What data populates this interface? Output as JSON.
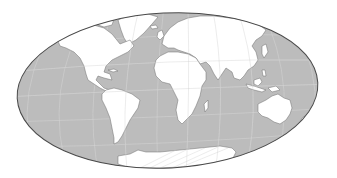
{
  "map": {
    "title": "World map (Mollweide-style equal-area projection)",
    "projection": "mollweide",
    "colors": {
      "ocean": "#bcbcbc",
      "land": "#ffffff",
      "coastline": "#6e6e6e",
      "graticule": "#d8d8d8",
      "outline": "#4a4a4a",
      "background": "#ffffff"
    },
    "graticule": {
      "meridians": 12,
      "parallels": 5
    },
    "continents": [
      {
        "name": "North America"
      },
      {
        "name": "South America"
      },
      {
        "name": "Europe"
      },
      {
        "name": "Africa"
      },
      {
        "name": "Asia"
      },
      {
        "name": "Australia"
      },
      {
        "name": "Antarctica"
      },
      {
        "name": "Greenland"
      }
    ]
  }
}
